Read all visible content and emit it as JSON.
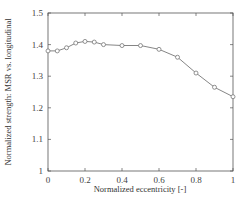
{
  "chart_data": {
    "type": "line",
    "title": "",
    "xlabel": "Normalized eccentricity [-]",
    "ylabel": "Normalized strength: MSR vs. longitudinal",
    "xlim": [
      0,
      1
    ],
    "ylim": [
      1,
      1.5
    ],
    "xticks": [
      0,
      0.2,
      0.4,
      0.6,
      0.8,
      1
    ],
    "xtick_labels": [
      "0",
      "0.2",
      "0.4",
      "0.6",
      "0.8",
      "1"
    ],
    "yticks": [
      1,
      1.1,
      1.2,
      1.3,
      1.4,
      1.5
    ],
    "ytick_labels": [
      "1",
      "1.1",
      "1.2",
      "1.3",
      "1.4",
      "1.5"
    ],
    "grid": false,
    "legend": null,
    "series": [
      {
        "name": "MSR vs. longitudinal",
        "marker": "circle",
        "color": "#777777",
        "x": [
          0,
          0.05,
          0.1,
          0.15,
          0.2,
          0.25,
          0.3,
          0.4,
          0.5,
          0.6,
          0.7,
          0.8,
          0.9,
          1.0
        ],
        "values": [
          1.38,
          1.38,
          1.39,
          1.405,
          1.41,
          1.408,
          1.4,
          1.397,
          1.397,
          1.385,
          1.36,
          1.31,
          1.265,
          1.235
        ]
      }
    ]
  }
}
